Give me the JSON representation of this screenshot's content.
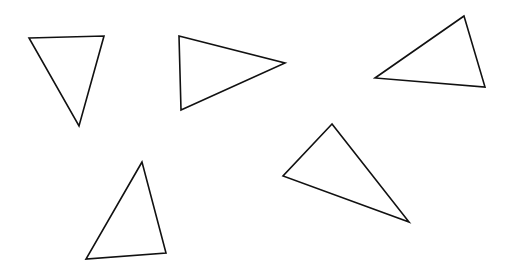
{
  "canvas": {
    "width": 510,
    "height": 275,
    "background": "#ffffff",
    "stroke": "#111111"
  },
  "shapes": [
    {
      "type": "triangle",
      "points": [
        [
          29,
          38
        ],
        [
          104,
          36
        ],
        [
          79,
          126
        ]
      ]
    },
    {
      "type": "triangle",
      "points": [
        [
          179,
          36
        ],
        [
          285,
          63
        ],
        [
          181,
          110
        ]
      ]
    },
    {
      "type": "triangle",
      "points": [
        [
          464,
          16
        ],
        [
          375,
          78
        ],
        [
          485,
          87
        ]
      ]
    },
    {
      "type": "triangle",
      "points": [
        [
          332,
          124
        ],
        [
          283,
          176
        ],
        [
          409,
          222
        ]
      ]
    },
    {
      "type": "triangle",
      "points": [
        [
          142,
          162
        ],
        [
          86,
          259
        ],
        [
          166,
          253
        ]
      ]
    }
  ]
}
